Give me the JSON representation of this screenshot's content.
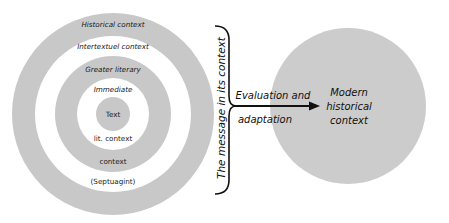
{
  "colors": {
    "ring_gray": "#c8c8c8",
    "background": "#ffffff",
    "ink": "#111111",
    "target_gray": "#cccccc"
  },
  "concentric_rings": {
    "labels": [
      {
        "text": "Historical context",
        "style": "italic"
      },
      {
        "text": "Intertextuel context",
        "style": "italic"
      },
      {
        "text": "Greater literary",
        "style": "italic"
      },
      {
        "text": "Immediate",
        "style": "italic"
      },
      {
        "text": "Text",
        "style": "normal"
      },
      {
        "text": "lit. context",
        "style": "normal"
      },
      {
        "text": "context",
        "style": "normal"
      },
      {
        "text": "(Septuagint)",
        "style": "normal"
      }
    ]
  },
  "brace": {
    "label": "The message in its context"
  },
  "arrow": {
    "label_line1": "Evaluation and",
    "label_line2": "adaptation"
  },
  "target_circle": {
    "line1": "Modern",
    "line2": "historical",
    "line3": "context"
  }
}
